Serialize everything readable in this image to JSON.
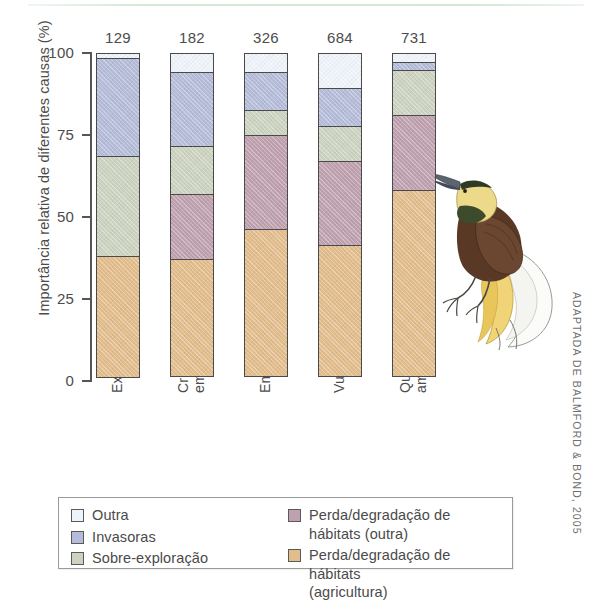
{
  "chart_data": {
    "type": "bar",
    "subtype": "stacked-percentage",
    "title": "",
    "xlabel": "",
    "ylabel": "Importância relativa de diferentes causas (%)",
    "ylim": [
      0,
      100
    ],
    "ytick_labels": [
      "100",
      "75",
      "50",
      "25",
      "0"
    ],
    "yticks": [
      100,
      75,
      50,
      25,
      0
    ],
    "grid": false,
    "legend_position": "bottom",
    "categories": [
      "Extinta",
      "Criticamente\nem perigo",
      "Em perigo",
      "Vulnerável",
      "Quase\nameaçada"
    ],
    "bar_count_labels": [
      "129",
      "182",
      "326",
      "684",
      "731"
    ],
    "series": [
      {
        "name": "Perda/degradação de hábitats (agricultura)",
        "color": "#e2bd8b",
        "values": [
          37,
          36,
          45,
          40,
          57
        ]
      },
      {
        "name": "Perda/degradação de hábitats (outra)",
        "color": "#bfa0ae",
        "values": [
          0,
          20,
          29,
          26,
          23
        ]
      },
      {
        "name": "Sobre-exploração",
        "color": "#ccd2c0",
        "values": [
          31,
          15,
          8,
          11,
          14
        ]
      },
      {
        "name": "Invasoras",
        "color": "#b4bcd9",
        "values": [
          30,
          23,
          12,
          12,
          3
        ]
      },
      {
        "name": "Outra",
        "color": "#eef4fa",
        "values": [
          2,
          6,
          6,
          11,
          3
        ]
      }
    ]
  },
  "axis": {
    "y_title": "Importância relativa de diferentes causas (%)",
    "ticks": [
      {
        "label": "100",
        "value": 100
      },
      {
        "label": "75",
        "value": 75
      },
      {
        "label": "50",
        "value": 50
      },
      {
        "label": "25",
        "value": 25
      },
      {
        "label": "0",
        "value": 0
      }
    ]
  },
  "bars": [
    {
      "count": "129",
      "category": "Extinta"
    },
    {
      "count": "182",
      "category": "Criticamente\nem perigo"
    },
    {
      "count": "326",
      "category": "Em perigo"
    },
    {
      "count": "684",
      "category": "Vulnerável"
    },
    {
      "count": "731",
      "category": "Quase\nameaçada"
    }
  ],
  "legend": {
    "column_1": [
      {
        "label": "Outra",
        "color": "#eef4fa"
      },
      {
        "label": "Invasoras",
        "color": "#b4bcd9"
      },
      {
        "label": "Sobre-exploração",
        "color": "#ccd2c0"
      }
    ],
    "column_2": [
      {
        "label": "Perda/degradação de hábitats (outra)",
        "color": "#bfa0ae"
      },
      {
        "label": "Perda/degradação de hábitats\n(agricultura)",
        "color": "#e2bd8b"
      }
    ]
  },
  "credit": "ADAPTADA DE BALMFORD & BOND, 2005",
  "illustration": {
    "name": "bird-of-paradise-illustration"
  }
}
